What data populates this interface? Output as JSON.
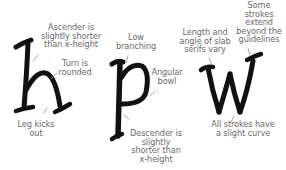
{
  "diagram": {
    "letters": [
      {
        "char": "h",
        "name": "letter-h"
      },
      {
        "char": "p",
        "name": "letter-p"
      },
      {
        "char": "w",
        "name": "letter-w"
      }
    ],
    "annotations": {
      "ascender": "Ascender is\nslightly shorter\nthan x-height",
      "turn": "Turn is\nrounded",
      "leg": "Leg kicks\nout",
      "branching": "Low\nbranching",
      "bowl": "Angular\nbowl",
      "descender": "Descender is\nslightly\nshorter than\nx-height",
      "serifs": "Length and\nangle of slab\nserifs vary",
      "extend": "Some\nstrokes\nextend\nbeyond the\nguidelines",
      "curve": "All strokes have\na slight curve"
    },
    "colors": {
      "ink": "#111111",
      "label": "#6a6a6a",
      "arrow": "#9a9a9a",
      "background": "#ffffff"
    }
  }
}
